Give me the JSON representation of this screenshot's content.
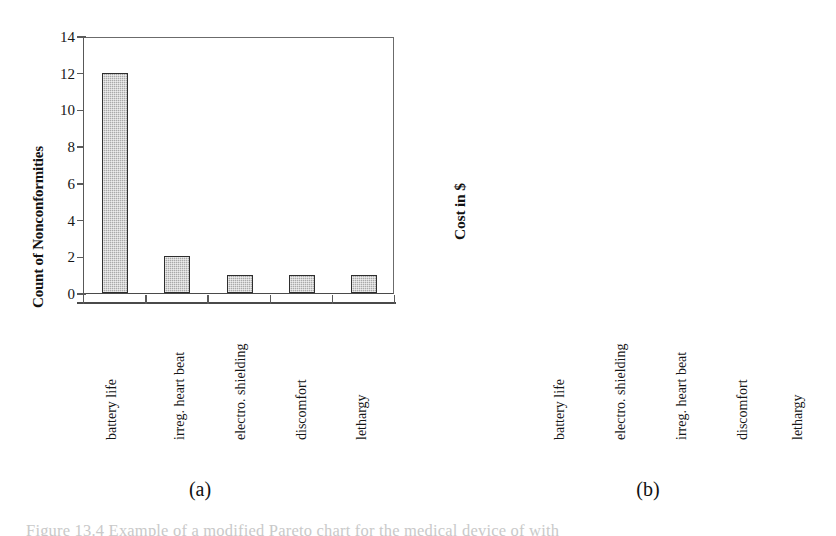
{
  "figure": {
    "panel_a_caption": "(a)",
    "panel_b_caption": "(b)",
    "bottom_caption_partial": "Figure 13.4  Example of a modified Pareto chart for the medical device of with"
  },
  "chart_data": [
    {
      "id": "a",
      "type": "bar",
      "title": "",
      "xlabel": "",
      "ylabel": "Count of Nonconformities",
      "categories": [
        "battery life",
        "irreg. heart beat",
        "electro. shielding",
        "discomfort",
        "lethargy"
      ],
      "values": [
        12,
        2,
        1,
        1,
        1
      ],
      "yticks": [
        "0",
        "2",
        "4",
        "6",
        "8",
        "10",
        "12",
        "14"
      ],
      "ytick_values": [
        0,
        2,
        4,
        6,
        8,
        10,
        12,
        14
      ],
      "ylim": [
        0,
        14
      ],
      "grid": false,
      "legend": "none",
      "bar_color": "#a9a9a9",
      "bar_edge_color": "#2e2e2e"
    },
    {
      "id": "b",
      "type": "bar",
      "title": "",
      "xlabel": "",
      "ylabel": "Cost in $",
      "categories": [
        "battery life",
        "electro. shielding",
        "irreg. heart beat",
        "discomfort",
        "lethargy"
      ],
      "values": [
        114000,
        110000,
        1000,
        0,
        0
      ],
      "yticks": [
        "0",
        "20000",
        "40000",
        "60000",
        "80000",
        "100000",
        "120000"
      ],
      "ytick_values": [
        0,
        20000,
        40000,
        60000,
        80000,
        100000,
        120000
      ],
      "ylim": [
        0,
        120000
      ],
      "grid": false,
      "legend": "none",
      "bar_color": "#a9a9a9",
      "bar_edge_color": "#2e2e2e"
    }
  ]
}
